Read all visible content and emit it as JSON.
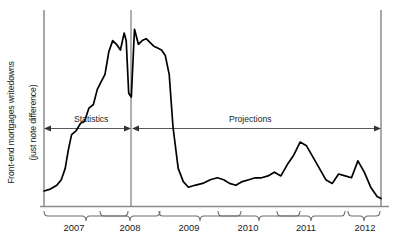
{
  "chart_data": {
    "type": "line",
    "title": "",
    "subtitle": "",
    "xlabel": "",
    "ylabel": "Front-end mortgages writedowns\n(just note difference)",
    "ylabel_lines": [
      "Front-end mortgages writedowns",
      "(just note difference)"
    ],
    "grid": false,
    "legend": "none",
    "axis_style": "left-spine-and-baseline",
    "tick_labels": [
      "2007",
      "2008",
      "2009",
      "2010",
      "2011",
      "2012"
    ],
    "tick_label_style": "curly-brace-groups",
    "x": [
      2006.75,
      2006.85,
      2006.95,
      2007.02,
      2007.08,
      2007.13,
      2007.18,
      2007.25,
      2007.32,
      2007.38,
      2007.45,
      2007.52,
      2007.58,
      2007.64,
      2007.7,
      2007.76,
      2007.82,
      2007.88,
      2007.94,
      2008.0,
      2008.03,
      2008.07,
      2008.11,
      2008.16,
      2008.22,
      2008.28,
      2008.34,
      2008.4,
      2008.46,
      2008.52,
      2008.58,
      2008.64,
      2008.7,
      2008.76,
      2008.84,
      2008.92,
      2009.0,
      2009.1,
      2009.22,
      2009.34,
      2009.45,
      2009.55,
      2009.64,
      2009.74,
      2009.84,
      2009.94,
      2010.04,
      2010.14,
      2010.24,
      2010.34,
      2010.44,
      2010.54,
      2010.64,
      2010.74,
      2010.84,
      2010.94,
      2011.04,
      2011.14,
      2011.24,
      2011.34,
      2011.44,
      2011.54,
      2011.64,
      2011.74,
      2011.84,
      2011.94,
      2012.0
    ],
    "values": [
      8,
      9,
      11,
      14,
      20,
      30,
      38,
      40,
      44,
      45,
      52,
      54,
      62,
      66,
      70,
      82,
      88,
      86,
      83,
      92,
      88,
      60,
      58,
      94,
      86,
      88,
      89,
      87,
      85,
      84,
      83,
      80,
      70,
      42,
      20,
      13,
      10,
      11,
      12,
      14,
      15,
      14,
      12,
      11,
      13,
      14,
      15,
      15,
      16,
      18,
      16,
      22,
      27,
      34,
      32,
      26,
      20,
      14,
      12,
      17,
      16,
      15,
      24,
      18,
      10,
      5,
      4
    ],
    "ylim": [
      0,
      100
    ],
    "xlim": [
      2006.75,
      2012.0
    ],
    "annotations": [
      {
        "name": "statistics-span",
        "label": "Statistics",
        "kind": "double-arrow",
        "x_start": 2006.75,
        "x_end": 2008.0
      },
      {
        "name": "projections-span",
        "label": "Projections",
        "kind": "double-arrow",
        "x_start": 2008.0,
        "x_end": 2012.0
      },
      {
        "name": "period-divider",
        "label": "",
        "kind": "vertical-line",
        "x": 2008.0
      }
    ],
    "line_color": "#000000",
    "axis_color": "#808080",
    "annotation_color": "#595959"
  },
  "axis": {
    "y_label_line1": "Front-end mortgages writedowns",
    "y_label_line2": "(just note difference)",
    "ticks": [
      {
        "label": "2007"
      },
      {
        "label": "2008"
      },
      {
        "label": "2009"
      },
      {
        "label": "2010"
      },
      {
        "label": "2011"
      },
      {
        "label": "2012"
      }
    ]
  },
  "annotations": {
    "statistics_label": "Statistics",
    "projections_label": "Projections"
  }
}
